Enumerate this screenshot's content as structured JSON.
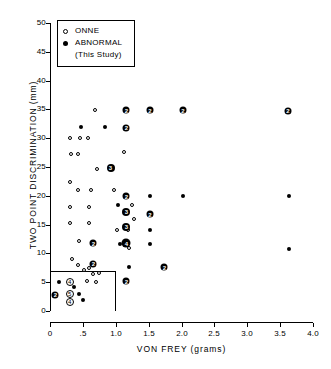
{
  "chart_data": {
    "type": "scatter",
    "title": "",
    "xlabel": "VON FREY (grams)",
    "ylabel": "TWO POINT DISCRIMINATION (mm)",
    "xlim": [
      0,
      4.0
    ],
    "ylim": [
      0,
      50
    ],
    "xticks": [
      "0",
      ".5",
      "1.0",
      "1.5",
      "2.0",
      "2.5",
      "3.0",
      "3.5",
      "4.0"
    ],
    "xtick_values": [
      0,
      0.5,
      1.0,
      1.5,
      2.0,
      2.5,
      3.0,
      3.5,
      4.0
    ],
    "yticks": [
      "0",
      "5",
      "10",
      "15",
      "20",
      "25",
      "30",
      "35",
      "40",
      "45",
      "50"
    ],
    "ytick_values": [
      0,
      5,
      10,
      15,
      20,
      25,
      30,
      35,
      40,
      45,
      50
    ],
    "grid": false,
    "legend_position": "top-left",
    "legend": [
      {
        "label": "ONNE",
        "marker": "open-circle"
      },
      {
        "label": "ABNORMAL",
        "marker": "filled-circle"
      },
      {
        "label": "(This Study)",
        "marker": "none"
      }
    ],
    "annotations": [
      {
        "type": "rect",
        "x0": 0.0,
        "y0": 0.0,
        "x1": 1.0,
        "y1": 7.0,
        "note": "normal reference range box"
      }
    ],
    "series": [
      {
        "name": "ONNE",
        "marker": "open-circle",
        "points": [
          {
            "x": 0.68,
            "y": 34.9
          },
          {
            "x": 0.72,
            "y": 24.6
          },
          {
            "x": 1.12,
            "y": 27.6
          },
          {
            "x": 0.3,
            "y": 30.0
          },
          {
            "x": 0.45,
            "y": 30.0
          },
          {
            "x": 0.58,
            "y": 30.0
          },
          {
            "x": 0.32,
            "y": 27.2
          },
          {
            "x": 0.42,
            "y": 27.2
          },
          {
            "x": 0.3,
            "y": 22.4
          },
          {
            "x": 0.42,
            "y": 21.0
          },
          {
            "x": 0.62,
            "y": 21.0
          },
          {
            "x": 0.97,
            "y": 21.0
          },
          {
            "x": 0.3,
            "y": 18.0
          },
          {
            "x": 0.6,
            "y": 18.0
          },
          {
            "x": 1.24,
            "y": 18.4
          },
          {
            "x": 0.3,
            "y": 15.2
          },
          {
            "x": 0.6,
            "y": 15.2
          },
          {
            "x": 1.02,
            "y": 14.0
          },
          {
            "x": 1.18,
            "y": 14.0
          },
          {
            "x": 1.27,
            "y": 16.0
          },
          {
            "x": 0.44,
            "y": 12.2
          },
          {
            "x": 1.2,
            "y": 11.0
          },
          {
            "x": 0.34,
            "y": 9.0
          },
          {
            "x": 0.42,
            "y": 8.0
          },
          {
            "x": 0.52,
            "y": 7.2
          },
          {
            "x": 0.6,
            "y": 7.4
          },
          {
            "x": 0.66,
            "y": 6.4
          },
          {
            "x": 0.74,
            "y": 6.6
          },
          {
            "x": 0.56,
            "y": 5.2
          },
          {
            "x": 0.7,
            "y": 5.0
          }
        ]
      },
      {
        "name": "ABNORMAL (This Study)",
        "marker": "filled-circle",
        "points": [
          {
            "x": 0.47,
            "y": 31.9
          },
          {
            "x": 0.84,
            "y": 31.9
          },
          {
            "x": 1.52,
            "y": 19.9
          },
          {
            "x": 2.02,
            "y": 19.9
          },
          {
            "x": 1.52,
            "y": 14.0
          },
          {
            "x": 1.52,
            "y": 11.6
          },
          {
            "x": 1.07,
            "y": 11.6
          },
          {
            "x": 3.64,
            "y": 19.9
          },
          {
            "x": 3.64,
            "y": 10.8
          },
          {
            "x": 0.14,
            "y": 5.0
          },
          {
            "x": 0.36,
            "y": 4.2
          },
          {
            "x": 0.44,
            "y": 3.0
          },
          {
            "x": 0.5,
            "y": 2.0
          },
          {
            "x": 1.2,
            "y": 7.6
          },
          {
            "x": 1.04,
            "y": 18.4
          }
        ]
      },
      {
        "name": "ABNORMAL (multi-count markers)",
        "marker": "numbered-filled-circle",
        "points": [
          {
            "x": 1.16,
            "y": 34.9,
            "count": 2
          },
          {
            "x": 1.52,
            "y": 34.9,
            "count": 2
          },
          {
            "x": 2.02,
            "y": 34.9,
            "count": 2
          },
          {
            "x": 3.62,
            "y": 34.8,
            "count": 2
          },
          {
            "x": 1.16,
            "y": 31.8,
            "count": 2
          },
          {
            "x": 0.92,
            "y": 24.8,
            "count": 3
          },
          {
            "x": 1.16,
            "y": 19.9,
            "count": 2
          },
          {
            "x": 1.16,
            "y": 17.2,
            "count": 3
          },
          {
            "x": 1.16,
            "y": 14.6,
            "count": 3
          },
          {
            "x": 1.16,
            "y": 11.8,
            "count": 4
          },
          {
            "x": 0.66,
            "y": 11.8,
            "count": 2
          },
          {
            "x": 1.52,
            "y": 16.8,
            "count": 2
          },
          {
            "x": 1.74,
            "y": 7.6,
            "count": 2
          },
          {
            "x": 0.08,
            "y": 2.8,
            "count": 2
          },
          {
            "x": 0.66,
            "y": 8.2,
            "count": 2
          },
          {
            "x": 1.16,
            "y": 5.2,
            "count": 2
          }
        ]
      },
      {
        "name": "ONNE (multi-count markers)",
        "marker": "numbered-open-circle",
        "points": [
          {
            "x": 0.3,
            "y": 5.0,
            "count": 4
          },
          {
            "x": 0.3,
            "y": 3.0,
            "count": 5
          },
          {
            "x": 0.3,
            "y": 1.6,
            "count": 4
          }
        ]
      }
    ]
  },
  "legend_box": {
    "rows": [
      {
        "marker": "open-circle",
        "label": "ONNE"
      },
      {
        "marker": "filled-circle",
        "label": "ABNORMAL"
      }
    ],
    "sub_label": "(This Study)"
  },
  "axes": {
    "x_title": "VON FREY (grams)",
    "y_title": "TWO POINT DISCRIMINATION  (mm)"
  }
}
